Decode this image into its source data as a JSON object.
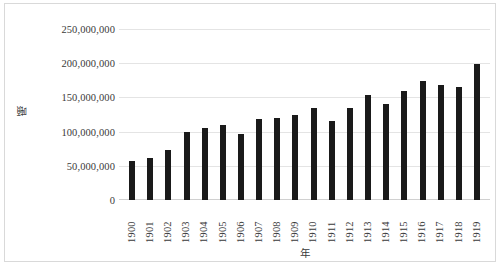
{
  "chart_data": {
    "type": "bar",
    "title": "",
    "xlabel": "年",
    "ylabel": "噸",
    "categories": [
      "1900",
      "1901",
      "1902",
      "1903",
      "1904",
      "1905",
      "1906",
      "1907",
      "1908",
      "1909",
      "1910",
      "1911",
      "1912",
      "1913",
      "1914",
      "1915",
      "1916",
      "1917",
      "1918",
      "1919"
    ],
    "values": [
      57000000,
      62000000,
      73000000,
      99000000,
      106000000,
      109000000,
      96000000,
      118000000,
      120000000,
      125000000,
      134000000,
      116000000,
      134000000,
      153000000,
      140000000,
      160000000,
      174000000,
      168000000,
      165000000,
      199000000
    ],
    "ylim": [
      0,
      250000000
    ],
    "y_ticks": [
      0,
      50000000,
      100000000,
      150000000,
      200000000,
      250000000
    ],
    "y_tick_labels": [
      "0",
      "50,000,000",
      "100,000,000",
      "150,000,000",
      "200,000,000",
      "250,000,000"
    ],
    "grid": true,
    "legend": "none",
    "bar_color": "#1a1a1a",
    "gridline_color": "#e4e4e4",
    "plot_background": "#ffffff",
    "frame_border_color": "#d9d9d9"
  }
}
